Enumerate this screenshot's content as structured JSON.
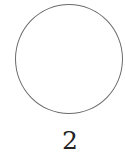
{
  "figure": {
    "shape": "circle",
    "stroke_color": "#6b6b6b",
    "fill_color": "#ffffff",
    "label": "2"
  }
}
